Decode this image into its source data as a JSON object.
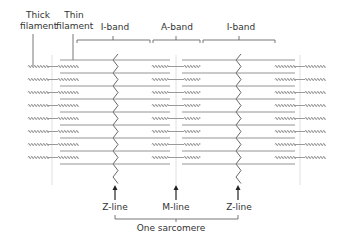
{
  "labels": {
    "thick_filament_line1": "Thick",
    "thick_filament_line2": "filament",
    "thin_filament_line1": "Thin",
    "thin_filament_line2": "filament",
    "i_band_left": "I-band",
    "a_band": "A-band",
    "i_band_right": "I-band",
    "z_line_left": "Z-line",
    "m_line": "M-line",
    "z_line_right": "Z-line",
    "sarcomere": "One sarcomere"
  },
  "colors": {
    "line": "#555555",
    "thin_filament": "#888888",
    "thick_filament": "#9a9a9a",
    "guide": "#d8d8d8",
    "text": "#333333"
  },
  "geometry": {
    "z_left_x": 115,
    "m_x": 176,
    "z_right_x": 238,
    "rows": 9
  }
}
